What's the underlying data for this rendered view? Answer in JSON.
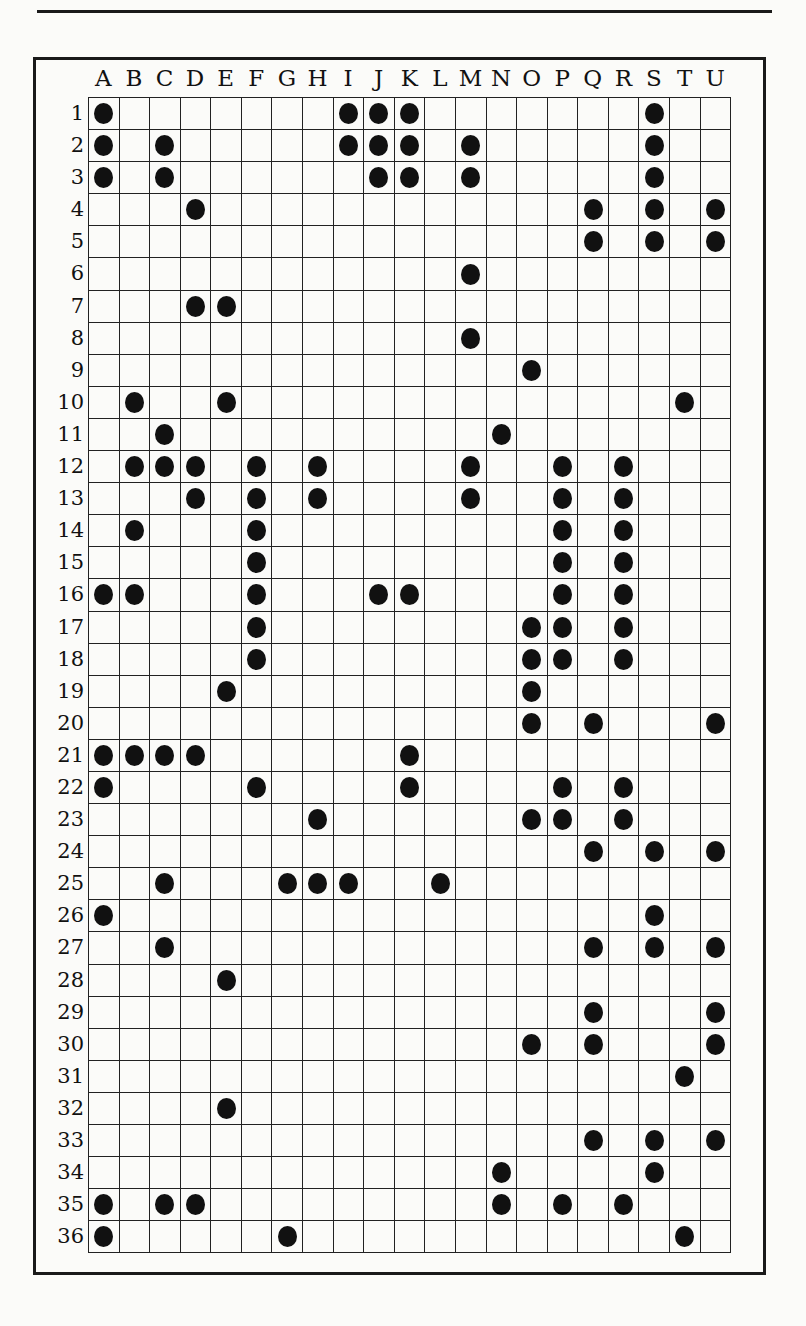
{
  "columns": [
    "A",
    "B",
    "C",
    "D",
    "E",
    "F",
    "G",
    "H",
    "I",
    "J",
    "K",
    "L",
    "M",
    "N",
    "O",
    "P",
    "Q",
    "R",
    "S",
    "T",
    "U"
  ],
  "rows": [
    {
      "label": "1",
      "dots": [
        "A",
        "I",
        "J",
        "K",
        "S"
      ]
    },
    {
      "label": "2",
      "dots": [
        "A",
        "C",
        "I",
        "J",
        "K",
        "M",
        "S"
      ]
    },
    {
      "label": "3",
      "dots": [
        "A",
        "C",
        "J",
        "K",
        "M",
        "S"
      ]
    },
    {
      "label": "4",
      "dots": [
        "D",
        "Q",
        "S",
        "U"
      ]
    },
    {
      "label": "5",
      "dots": [
        "Q",
        "S",
        "U"
      ]
    },
    {
      "label": "6",
      "dots": [
        "M"
      ]
    },
    {
      "label": "7",
      "dots": [
        "D",
        "E"
      ]
    },
    {
      "label": "8",
      "dots": [
        "M"
      ]
    },
    {
      "label": "9",
      "dots": [
        "O"
      ]
    },
    {
      "label": "10",
      "dots": [
        "B",
        "E",
        "T"
      ]
    },
    {
      "label": "11",
      "dots": [
        "C",
        "N"
      ]
    },
    {
      "label": "12",
      "dots": [
        "B",
        "C",
        "D",
        "F",
        "H",
        "M",
        "P",
        "R"
      ]
    },
    {
      "label": "13",
      "dots": [
        "D",
        "F",
        "H",
        "M",
        "P",
        "R"
      ]
    },
    {
      "label": "14",
      "dots": [
        "B",
        "F",
        "P",
        "R"
      ]
    },
    {
      "label": "15",
      "dots": [
        "F",
        "P",
        "R"
      ]
    },
    {
      "label": "16",
      "dots": [
        "A",
        "B",
        "F",
        "J",
        "K",
        "P",
        "R"
      ]
    },
    {
      "label": "17",
      "dots": [
        "F",
        "O",
        "P",
        "R"
      ]
    },
    {
      "label": "18",
      "dots": [
        "F",
        "O",
        "P",
        "R"
      ]
    },
    {
      "label": "19",
      "dots": [
        "E",
        "O"
      ]
    },
    {
      "label": "20",
      "dots": [
        "O",
        "Q",
        "U"
      ]
    },
    {
      "label": "21",
      "dots": [
        "A",
        "B",
        "C",
        "D",
        "K"
      ]
    },
    {
      "label": "22",
      "dots": [
        "A",
        "F",
        "K",
        "P",
        "R"
      ]
    },
    {
      "label": "23",
      "dots": [
        "H",
        "O",
        "P",
        "R"
      ]
    },
    {
      "label": "24",
      "dots": [
        "Q",
        "S",
        "U"
      ]
    },
    {
      "label": "25",
      "dots": [
        "C",
        "G",
        "H",
        "I",
        "L"
      ]
    },
    {
      "label": "26",
      "dots": [
        "A",
        "S"
      ]
    },
    {
      "label": "27",
      "dots": [
        "C",
        "Q",
        "S",
        "U"
      ]
    },
    {
      "label": "28",
      "dots": [
        "E"
      ]
    },
    {
      "label": "29",
      "dots": [
        "Q",
        "U"
      ]
    },
    {
      "label": "30",
      "dots": [
        "O",
        "Q",
        "U"
      ]
    },
    {
      "label": "31",
      "dots": [
        "T"
      ]
    },
    {
      "label": "32",
      "dots": [
        "E"
      ]
    },
    {
      "label": "33",
      "dots": [
        "Q",
        "S",
        "U"
      ]
    },
    {
      "label": "34",
      "dots": [
        "N",
        "S"
      ]
    },
    {
      "label": "35",
      "dots": [
        "A",
        "C",
        "D",
        "N",
        "P",
        "R"
      ]
    },
    {
      "label": "36",
      "dots": [
        "A",
        "G",
        "T"
      ]
    }
  ],
  "colors": {
    "ink": "#111111",
    "paper": "#fbfbf9"
  }
}
